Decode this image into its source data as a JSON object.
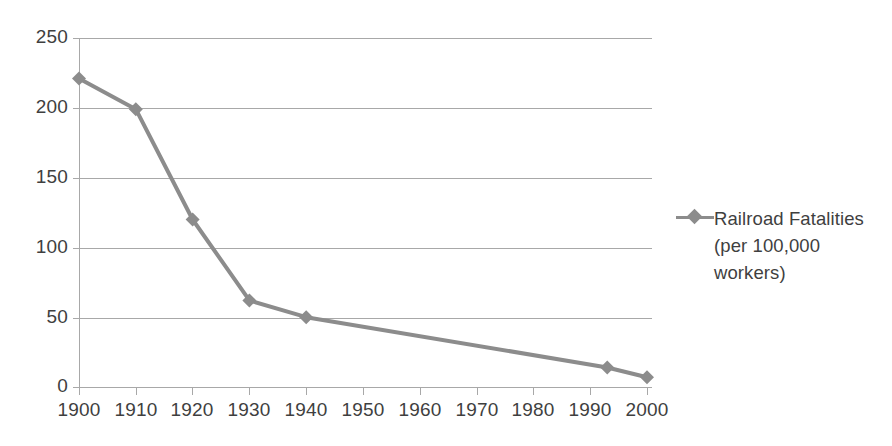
{
  "chart_data": {
    "type": "line",
    "title": "",
    "xlabel": "",
    "ylabel": "",
    "xlim": [
      1900,
      2000
    ],
    "ylim": [
      0,
      250
    ],
    "grid": true,
    "legend_position": "right",
    "x_ticks": [
      "1900",
      "1910",
      "1920",
      "1930",
      "1940",
      "1950",
      "1960",
      "1970",
      "1980",
      "1990",
      "2000"
    ],
    "y_ticks": [
      "0",
      "50",
      "100",
      "150",
      "200",
      "250"
    ],
    "series": [
      {
        "name": "Railroad Fatalities (per 100,000 workers)",
        "marker": "diamond",
        "color": "#8c8c8c",
        "x": [
          1900,
          1910,
          1920,
          1930,
          1940,
          1993,
          2000
        ],
        "values": [
          221,
          199,
          120,
          62,
          50,
          14,
          7
        ]
      }
    ],
    "legend": [
      {
        "label_lines": [
          "Railroad Fatalities",
          "(per 100,000",
          "workers)"
        ],
        "marker": "line-diamond-marker",
        "color": "#8c8c8c"
      }
    ]
  },
  "axes": {
    "y_tick_labels": [
      "250",
      "200",
      "150",
      "100",
      "50",
      "0"
    ],
    "x_tick_labels": [
      "1900",
      "1910",
      "1920",
      "1930",
      "1940",
      "1950",
      "1960",
      "1970",
      "1980",
      "1990",
      "2000"
    ]
  },
  "legend": {
    "line1": "Railroad Fatalities",
    "line2": "(per 100,000",
    "line3": "workers)"
  },
  "colors": {
    "series": "#8c8c8c",
    "grid": "#a8a8a8",
    "text": "#3f3f3f",
    "background": "#ffffff"
  }
}
